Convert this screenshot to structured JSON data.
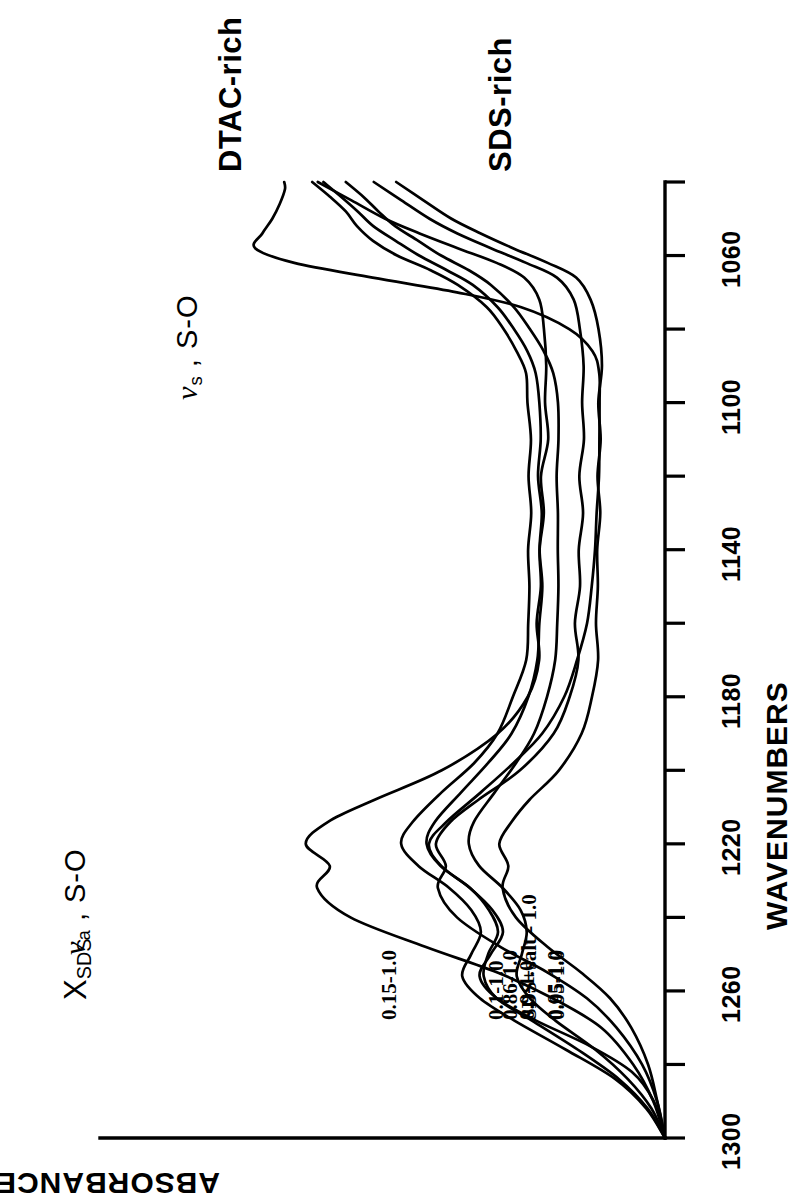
{
  "figure": {
    "title": "",
    "background_color": "#ffffff",
    "ink_color": "#000000",
    "orientation": "rotated-90-ccw"
  },
  "axes": {
    "x_axis_title": "WAVENUMBERS",
    "y_axis_title": "ABSORBANCE",
    "x_tick_labels": [
      "1300",
      "1260",
      "1220",
      "1180",
      "1140",
      "1100",
      "1060"
    ],
    "x_tick_values": [
      1300,
      1260,
      1220,
      1180,
      1140,
      1100,
      1060
    ],
    "x_minor_step": 20,
    "x_range": [
      1300,
      1040
    ],
    "y_ticks_shown": false
  },
  "annotations": {
    "composition_variable": "X",
    "composition_variable_sub": "SDS",
    "mode_asym": "ν",
    "mode_asym_sub": "a",
    "mode_asym_rest": " , S-O",
    "mode_sym": "ν",
    "mode_sym_sub": "s",
    "mode_sym_rest": " , S-O",
    "region_top": "DTAC-rich",
    "region_bottom": "SDS-rich"
  },
  "chart_data": {
    "type": "line",
    "title": "",
    "subtitle": "",
    "xlabel": "WAVENUMBERS",
    "ylabel": "ABSORBANCE",
    "xlim": [
      1300,
      1040
    ],
    "ylim": [
      0,
      1
    ],
    "grid": false,
    "legend": "inline-curve-labels",
    "peaks": {
      "nu_a_S_O": 1220,
      "nu_s_S_O": 1060
    },
    "series": [
      {
        "name": "0.15-1.0",
        "group": "DTAC-rich",
        "label": "0.15-1.0",
        "offset": 0.86,
        "x": [
          1300,
          1290,
          1280,
          1270,
          1262,
          1255,
          1248,
          1240,
          1232,
          1226,
          1220,
          1214,
          1208,
          1200,
          1190,
          1180,
          1170,
          1160,
          1150,
          1140,
          1130,
          1120,
          1110,
          1100,
          1090,
          1080,
          1072,
          1066,
          1062,
          1058,
          1054,
          1050,
          1045,
          1040
        ],
        "y": [
          0.0,
          0.02,
          0.055,
          0.115,
          0.2,
          0.3,
          0.43,
          0.56,
          0.62,
          0.6,
          0.64,
          0.6,
          0.52,
          0.4,
          0.3,
          0.245,
          0.225,
          0.23,
          0.22,
          0.225,
          0.215,
          0.22,
          0.21,
          0.215,
          0.21,
          0.215,
          0.225,
          0.25,
          0.3,
          0.37,
          0.44,
          0.5,
          0.56,
          0.62
        ]
      },
      {
        "name": "0.1-1.0",
        "group": "DTAC-rich",
        "label": "0.1-1.0",
        "offset": 0.8,
        "x": [
          1300,
          1290,
          1280,
          1270,
          1262,
          1255,
          1248,
          1240,
          1232,
          1226,
          1220,
          1214,
          1208,
          1200,
          1190,
          1180,
          1170,
          1160,
          1150,
          1140,
          1130,
          1120,
          1110,
          1100,
          1090,
          1080,
          1072,
          1066,
          1062,
          1058,
          1054,
          1050,
          1045,
          1040
        ],
        "y": [
          0.0,
          0.015,
          0.04,
          0.085,
          0.14,
          0.21,
          0.295,
          0.37,
          0.405,
          0.39,
          0.41,
          0.385,
          0.335,
          0.26,
          0.2,
          0.17,
          0.155,
          0.16,
          0.15,
          0.155,
          0.148,
          0.152,
          0.145,
          0.15,
          0.145,
          0.152,
          0.165,
          0.195,
          0.25,
          0.31,
          0.37,
          0.42,
          0.47,
          0.52
        ]
      },
      {
        "name": "0.05-1.0",
        "group": "DTAC-rich",
        "label": "0.05-1.0",
        "offset": 0.745,
        "x": [
          1300,
          1290,
          1280,
          1270,
          1262,
          1255,
          1248,
          1240,
          1232,
          1226,
          1220,
          1214,
          1208,
          1200,
          1190,
          1180,
          1170,
          1160,
          1150,
          1140,
          1130,
          1120,
          1110,
          1100,
          1090,
          1080,
          1072,
          1066,
          1062,
          1058,
          1054,
          1050,
          1045,
          1040
        ],
        "y": [
          0.0,
          0.012,
          0.03,
          0.06,
          0.1,
          0.15,
          0.21,
          0.265,
          0.29,
          0.28,
          0.295,
          0.275,
          0.24,
          0.19,
          0.15,
          0.13,
          0.12,
          0.125,
          0.118,
          0.122,
          0.116,
          0.12,
          0.114,
          0.118,
          0.114,
          0.12,
          0.132,
          0.16,
          0.21,
          0.27,
          0.33,
          0.38,
          0.43,
          0.48
        ]
      },
      {
        "name": "SDS+salt - 1.0",
        "group": "middle",
        "label": "SDS+salt - 1.0",
        "offset": 0.7,
        "x": [
          1300,
          1290,
          1282,
          1275,
          1268,
          1262,
          1256,
          1250,
          1244,
          1238,
          1232,
          1226,
          1220,
          1214,
          1206,
          1198,
          1190,
          1180,
          1170,
          1160,
          1150,
          1140,
          1130,
          1120,
          1110,
          1100,
          1092,
          1086,
          1080,
          1074,
          1070,
          1066,
          1062,
          1058,
          1054,
          1050,
          1046,
          1042,
          1040
        ],
        "y": [
          0.0,
          0.02,
          0.06,
          0.135,
          0.23,
          0.3,
          0.33,
          0.31,
          0.29,
          0.31,
          0.35,
          0.4,
          0.42,
          0.39,
          0.33,
          0.27,
          0.22,
          0.18,
          0.155,
          0.14,
          0.13,
          0.125,
          0.12,
          0.118,
          0.116,
          0.115,
          0.118,
          0.13,
          0.17,
          0.26,
          0.37,
          0.52,
          0.66,
          0.73,
          0.72,
          0.7,
          0.69,
          0.68,
          0.68
        ]
      },
      {
        "name": "0.86-1.0",
        "group": "SDS-rich",
        "label": "0.86-1.0",
        "offset": 0.3,
        "x": [
          1300,
          1292,
          1284,
          1276,
          1268,
          1262,
          1256,
          1250,
          1244,
          1238,
          1232,
          1226,
          1220,
          1214,
          1206,
          1198,
          1190,
          1180,
          1170,
          1160,
          1150,
          1140,
          1130,
          1120,
          1110,
          1100,
          1092,
          1086,
          1080,
          1074,
          1068,
          1064,
          1060,
          1056,
          1052,
          1048,
          1044,
          1040
        ],
        "y": [
          0.0,
          0.035,
          0.09,
          0.175,
          0.27,
          0.33,
          0.36,
          0.345,
          0.33,
          0.345,
          0.385,
          0.44,
          0.47,
          0.45,
          0.4,
          0.34,
          0.3,
          0.27,
          0.25,
          0.245,
          0.24,
          0.245,
          0.24,
          0.245,
          0.24,
          0.245,
          0.25,
          0.265,
          0.29,
          0.32,
          0.37,
          0.42,
          0.48,
          0.52,
          0.55,
          0.57,
          0.6,
          0.63
        ]
      },
      {
        "name": "0.9-1.0",
        "group": "SDS-rich",
        "label": "0.9-1.0",
        "offset": 0.205,
        "x": [
          1300,
          1292,
          1284,
          1276,
          1268,
          1262,
          1256,
          1250,
          1244,
          1238,
          1232,
          1226,
          1220,
          1214,
          1206,
          1198,
          1190,
          1180,
          1170,
          1160,
          1150,
          1140,
          1130,
          1120,
          1110,
          1100,
          1092,
          1086,
          1080,
          1074,
          1068,
          1064,
          1060,
          1056,
          1052,
          1048,
          1044,
          1040
        ],
        "y": [
          0.0,
          0.03,
          0.08,
          0.155,
          0.24,
          0.3,
          0.325,
          0.315,
          0.3,
          0.315,
          0.35,
          0.4,
          0.425,
          0.41,
          0.365,
          0.315,
          0.275,
          0.245,
          0.23,
          0.225,
          0.22,
          0.225,
          0.22,
          0.225,
          0.22,
          0.225,
          0.23,
          0.245,
          0.27,
          0.3,
          0.345,
          0.39,
          0.44,
          0.48,
          0.52,
          0.55,
          0.58,
          0.61
        ]
      },
      {
        "name": "0.95-1.0",
        "group": "SDS-rich",
        "label": "0.95-1.0",
        "offset": 0.105,
        "x": [
          1300,
          1292,
          1284,
          1276,
          1268,
          1262,
          1256,
          1250,
          1244,
          1238,
          1232,
          1226,
          1220,
          1214,
          1206,
          1198,
          1190,
          1180,
          1170,
          1160,
          1150,
          1140,
          1130,
          1120,
          1110,
          1100,
          1092,
          1086,
          1080,
          1074,
          1068,
          1064,
          1060,
          1056,
          1052,
          1048,
          1044,
          1040
        ],
        "y": [
          0.0,
          0.025,
          0.065,
          0.125,
          0.195,
          0.24,
          0.265,
          0.255,
          0.245,
          0.26,
          0.29,
          0.33,
          0.35,
          0.34,
          0.305,
          0.265,
          0.235,
          0.21,
          0.198,
          0.193,
          0.19,
          0.193,
          0.19,
          0.193,
          0.19,
          0.193,
          0.2,
          0.215,
          0.24,
          0.27,
          0.31,
          0.35,
          0.4,
          0.44,
          0.48,
          0.51,
          0.54,
          0.57
        ]
      }
    ]
  },
  "curve_label_positions": [
    {
      "name": "0.15-1.0",
      "x": 1235,
      "offset_px": 0
    },
    {
      "name": "0.1-1.0",
      "x": 1235,
      "offset_px": 0
    },
    {
      "name": "0.05-1.0",
      "x": 1235,
      "offset_px": 0
    },
    {
      "name": "SDS+salt - 1.0",
      "x": 1235,
      "offset_px": 0
    },
    {
      "name": "0.86-1.0",
      "x": 1235,
      "offset_px": 0
    },
    {
      "name": "0.9-1.0",
      "x": 1235,
      "offset_px": 0
    },
    {
      "name": "0.95-1.0",
      "x": 1235,
      "offset_px": 0
    }
  ]
}
